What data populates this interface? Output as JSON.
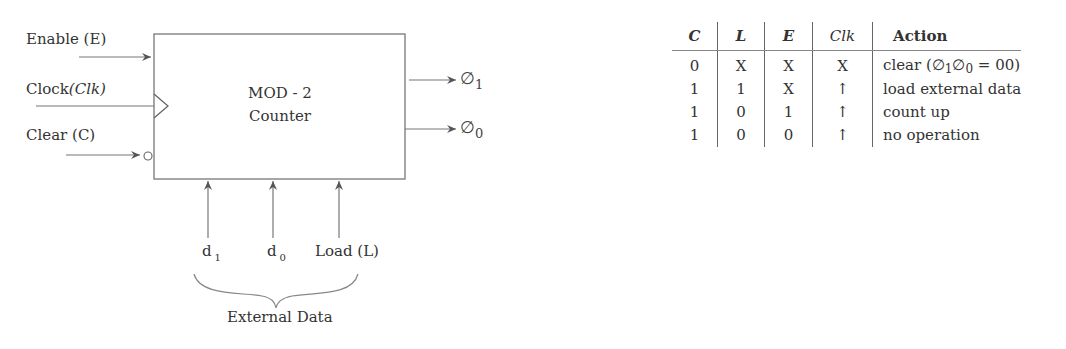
{
  "diagram": {
    "block": {
      "title_line1": "MOD - 2",
      "title_line2": "Counter"
    },
    "inputs": {
      "enable": "Enable (E)",
      "clock_prefix": "Clock",
      "clock_italic": "(Clk)",
      "clear": "Clear (C)"
    },
    "outputs": [
      {
        "symbol": "∅",
        "subscript": "1"
      },
      {
        "symbol": "∅",
        "subscript": "0"
      }
    ],
    "bottom_inputs": [
      {
        "label": "d",
        "subscript": "1"
      },
      {
        "label": "d",
        "subscript": "0"
      },
      {
        "label": "Load (L)",
        "subscript": ""
      }
    ],
    "brace_label": "External Data"
  },
  "truth_table": {
    "headers": [
      "C",
      "L",
      "E",
      "Clk",
      "Action"
    ],
    "rows": [
      {
        "C": "0",
        "L": "X",
        "E": "X",
        "Clk": "X",
        "action_pre": "clear (",
        "action_phi1": "∅",
        "action_s1": "1",
        "action_phi0": "∅",
        "action_s0": "0",
        "action_post": " = 00)"
      },
      {
        "C": "1",
        "L": "1",
        "E": "X",
        "Clk": "↑",
        "action": "load external data"
      },
      {
        "C": "1",
        "L": "0",
        "E": "1",
        "Clk": "↑",
        "action": "count up"
      },
      {
        "C": "1",
        "L": "0",
        "E": "0",
        "Clk": "↑",
        "action": "no operation"
      }
    ]
  },
  "colors": {
    "line": "#666666",
    "text": "#333333"
  }
}
